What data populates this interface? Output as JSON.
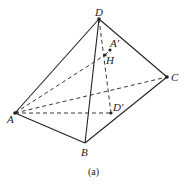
{
  "caption": "(a)",
  "points": {
    "D": {
      "label": "D",
      "x": 99,
      "y": 19
    },
    "A_prime": {
      "label": "A'",
      "x": 110,
      "y": 50
    },
    "H": {
      "label": "H",
      "x": 105,
      "y": 55
    },
    "C": {
      "label": "C",
      "x": 167,
      "y": 77
    },
    "A": {
      "label": "A",
      "x": 15,
      "y": 113
    },
    "D_prime": {
      "label": "D'",
      "x": 111,
      "y": 113
    },
    "B": {
      "label": "B",
      "x": 85,
      "y": 143
    }
  },
  "solid_edges": [
    [
      "D",
      "A"
    ],
    [
      "D",
      "B"
    ],
    [
      "D",
      "C"
    ],
    [
      "A",
      "B"
    ],
    [
      "B",
      "C"
    ]
  ],
  "dashed_edges": [
    [
      "A",
      "C"
    ],
    [
      "A",
      "D_prime"
    ],
    [
      "A",
      "H"
    ],
    [
      "D",
      "D_prime"
    ],
    [
      "H",
      "A_prime"
    ]
  ],
  "colors": {
    "line": "#222222",
    "background": "#ffffff"
  }
}
